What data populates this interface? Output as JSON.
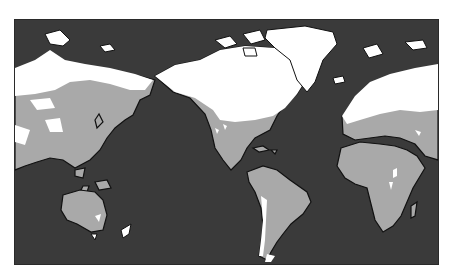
{
  "map": {
    "type": "world-map",
    "projection": "equirectangular, Pacific-centered",
    "colors": {
      "background": "#ffffff",
      "ocean": "#3a3a3a",
      "land": "#a9a9a9",
      "snow_cover": "#ffffff",
      "coastline": "#111111"
    },
    "regions": [
      "Asia",
      "Australia",
      "North America",
      "Greenland",
      "South America",
      "Europe",
      "Africa"
    ]
  }
}
